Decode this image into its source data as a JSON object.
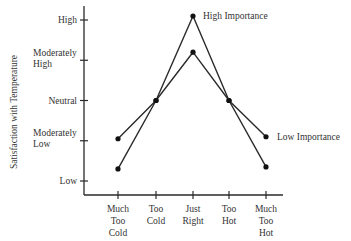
{
  "chart_data": {
    "type": "line",
    "title": "",
    "xlabel": "",
    "ylabel": "Satisfaction with Temperature",
    "categories": [
      [
        "Much",
        "Too",
        "Cold"
      ],
      [
        "Too",
        "Cold"
      ],
      [
        "Just",
        "Right"
      ],
      [
        "Too",
        "Hot"
      ],
      [
        "Much",
        "Too",
        "Hot"
      ]
    ],
    "y_ticks": [
      "Low",
      "Moderately Low",
      "Neutral",
      "Moderately High",
      "High"
    ],
    "y_tick_lines": [
      [
        "Low"
      ],
      [
        "Moderately",
        "Low"
      ],
      [
        "Neutral"
      ],
      [
        "Moderately",
        "High"
      ],
      [
        "High"
      ]
    ],
    "ylim": [
      0.6,
      5.4
    ],
    "grid": false,
    "series": [
      {
        "name": "High Importance",
        "values": [
          1.3,
          3.0,
          5.1,
          3.0,
          1.35
        ]
      },
      {
        "name": "Low Importance",
        "values": [
          2.05,
          3.0,
          4.2,
          3.0,
          2.1
        ]
      }
    ],
    "annotations": [
      "High Importance",
      "Low Importance"
    ]
  },
  "style": {
    "line_color": "#2a2a2a",
    "text_color": "#333333"
  }
}
